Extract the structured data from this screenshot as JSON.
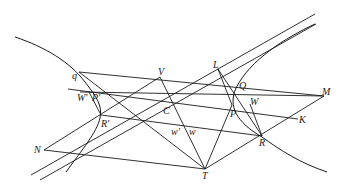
{
  "figure": {
    "type": "geometry-diagram",
    "labels": {
      "q": "q",
      "V": "V",
      "L": "L",
      "Q": "Q",
      "M": "M",
      "W_prime": "W'",
      "P_prime": "P'",
      "C": "C",
      "P": "P",
      "W": "W",
      "K": "K",
      "R_prime": "R'",
      "w_prime": "w'",
      "w": "w",
      "R": "R",
      "N": "N",
      "T": "T"
    },
    "line_color": "#1a1a1a",
    "background": "#ffffff"
  }
}
